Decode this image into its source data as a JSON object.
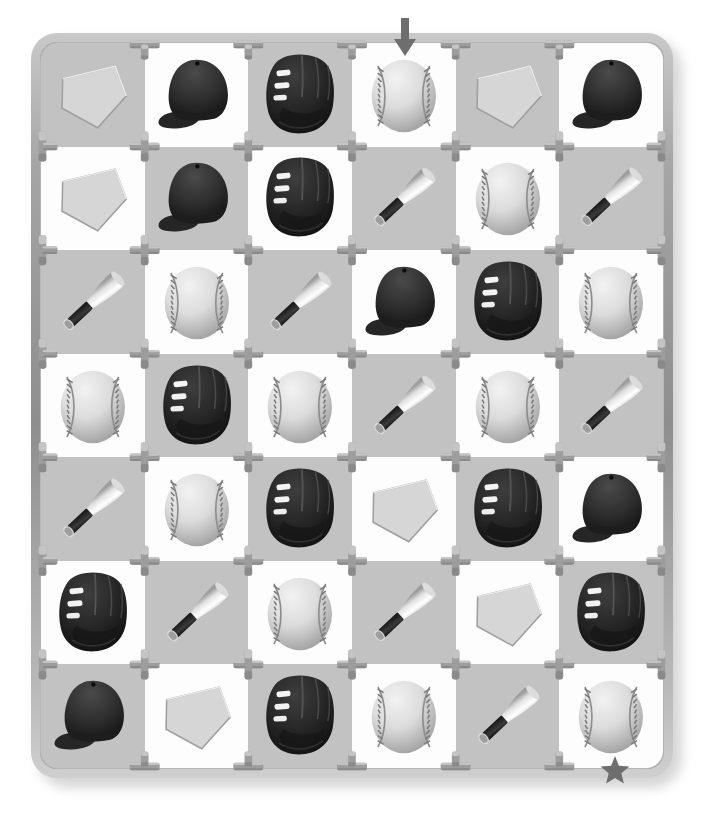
{
  "puzzle": {
    "title": "Baseball Equipment Maze Grid",
    "kind": "grid-maze",
    "columns": 6,
    "rows": 7,
    "entry": {
      "label": "entry-arrow",
      "icon": "down-arrow-icon",
      "column": 4,
      "side": "top"
    },
    "exit": {
      "label": "exit-star",
      "icon": "star-icon",
      "column": 6,
      "side": "bottom"
    },
    "colors": {
      "frame": "#9a9a9a",
      "frame_highlight": "#cfcfcf",
      "frame_shadow": "#8e8e8e",
      "cell_light": "#c2c2c2",
      "cell_white": "#fdfdfd",
      "connector": "#9d9d9d",
      "marker": "#6e6e6e",
      "ball_light": "#f2f2f2",
      "ball_dark": "#9a9a9a",
      "glove_dark": "#2b2b2b",
      "cap_dark": "#2e2e2e",
      "bat_barrel": "#f0f0f0",
      "bat_handle": "#2a2a2a",
      "plate_fill": "#d6d6d6"
    },
    "icon_names": {
      "plate": "home-plate-icon",
      "cap": "baseball-cap-icon",
      "glove": "baseball-glove-icon",
      "ball": "baseball-icon",
      "bat": "baseball-bat-icon"
    },
    "grid": [
      [
        "plate",
        "cap",
        "glove",
        "ball",
        "plate",
        "cap"
      ],
      [
        "plate",
        "cap",
        "glove",
        "bat",
        "ball",
        "bat"
      ],
      [
        "bat",
        "ball",
        "bat",
        "cap",
        "glove",
        "ball"
      ],
      [
        "ball",
        "glove",
        "ball",
        "bat",
        "ball",
        "bat"
      ],
      [
        "bat",
        "ball",
        "glove",
        "plate",
        "glove",
        "cap"
      ],
      [
        "glove",
        "bat",
        "ball",
        "bat",
        "plate",
        "glove"
      ],
      [
        "cap",
        "plate",
        "glove",
        "ball",
        "bat",
        "ball"
      ]
    ],
    "shading": [
      [
        "light",
        "white",
        "light",
        "white",
        "light",
        "white"
      ],
      [
        "white",
        "light",
        "white",
        "light",
        "white",
        "light"
      ],
      [
        "light",
        "white",
        "light",
        "white",
        "light",
        "white"
      ],
      [
        "white",
        "light",
        "white",
        "light",
        "white",
        "light"
      ],
      [
        "light",
        "white",
        "light",
        "white",
        "light",
        "white"
      ],
      [
        "white",
        "light",
        "white",
        "light",
        "white",
        "light"
      ],
      [
        "light",
        "white",
        "light",
        "white",
        "light",
        "white"
      ]
    ]
  }
}
